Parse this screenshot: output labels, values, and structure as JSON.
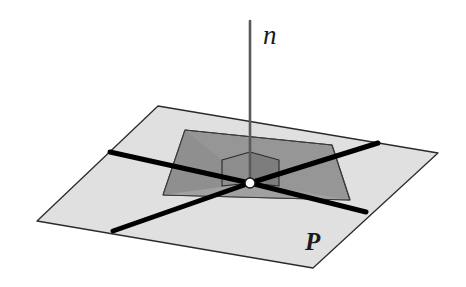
{
  "figure": {
    "background_color": "#ffffff",
    "width": 466,
    "height": 287
  },
  "labels": {
    "normal_line": "n",
    "plane": "P"
  },
  "label_positions": {
    "normal_line": {
      "x": 263,
      "y": 44
    },
    "plane": {
      "x": 305,
      "y": 250
    }
  },
  "colors": {
    "plane_fill": "#e0e0e0",
    "plane_mid_fill": "#c9c9c9",
    "inner_quad_fill": "#969696",
    "right_angle_fill": "#8d8d8d",
    "right_angle_fill_dark": "#808080",
    "outline": "#2b2b2b",
    "thick_line": "#000000",
    "normal_line": "#5a5a5a",
    "point_fill": "#ffffff",
    "point_stroke": "#1a1a1a",
    "label_color": "#1a1a1a"
  },
  "geometry": {
    "plane_outline": "158,106 438,153 313,268 37,221",
    "plane_inner_band": "185,130 332,145 350,200 163,195",
    "inner_quad": "185,130 332,145 350,200 163,195",
    "shade_left_wedge": "163,195 185,130 250,183",
    "shade_bottom_wedge": "163,195 250,183 350,200",
    "normal_line": {
      "x1": 250,
      "y1": 21,
      "x2": 250,
      "y2": 184
    },
    "foot_point": {
      "cx": 250,
      "cy": 183,
      "r": 5
    },
    "right_angle_marker": "222,160 250,152 279,160 279,186 250,194 222,186",
    "right_angle_left_face": "222,160 250,152 250,183 222,186",
    "right_angle_right_face": "250,152 279,160 279,186 250,183",
    "thick_lines": [
      {
        "name": "line-upper-left",
        "x1": 110,
        "y1": 152,
        "x2": 250,
        "y2": 183
      },
      {
        "name": "line-upper-right",
        "x1": 250,
        "y1": 183,
        "x2": 378,
        "y2": 143
      },
      {
        "name": "line-lower-left",
        "x1": 113,
        "y1": 231,
        "x2": 250,
        "y2": 183
      },
      {
        "name": "line-lower-right",
        "x1": 250,
        "y1": 183,
        "x2": 366,
        "y2": 212
      }
    ],
    "thin_creases": [
      {
        "name": "crease-left",
        "x1": 163,
        "y1": 195,
        "x2": 185,
        "y2": 130
      },
      {
        "name": "crease-right",
        "x1": 350,
        "y1": 200,
        "x2": 332,
        "y2": 145
      },
      {
        "name": "crease-top",
        "x1": 185,
        "y1": 130,
        "x2": 332,
        "y2": 145
      },
      {
        "name": "crease-bottom",
        "x1": 163,
        "y1": 195,
        "x2": 350,
        "y2": 200
      }
    ]
  },
  "annotations": {
    "right_angle_note": "right-angle marker at foot of normal",
    "point_note": "foot of the perpendicular"
  }
}
